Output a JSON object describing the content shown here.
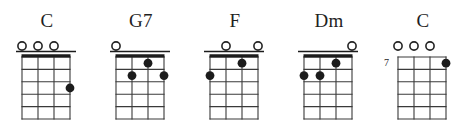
{
  "sheet": {
    "title": "Ukulele Chord Chart",
    "instrument": "ukulele",
    "string_count": 4,
    "fret_rows": 5,
    "background_color": "#ffffff",
    "ink_color": "#1c1c1c"
  },
  "chords": [
    {
      "name": "C",
      "position_label": "",
      "show_nut": true,
      "open_strings": [
        1,
        2,
        3
      ],
      "muted_strings": [],
      "dots": [
        {
          "string": 4,
          "fret": 3
        }
      ]
    },
    {
      "name": "G7",
      "position_label": "",
      "show_nut": true,
      "open_strings": [
        1
      ],
      "muted_strings": [],
      "dots": [
        {
          "string": 3,
          "fret": 1
        },
        {
          "string": 2,
          "fret": 2
        },
        {
          "string": 4,
          "fret": 2
        }
      ]
    },
    {
      "name": "F",
      "position_label": "",
      "show_nut": true,
      "open_strings": [
        2,
        4
      ],
      "muted_strings": [],
      "dots": [
        {
          "string": 3,
          "fret": 1
        },
        {
          "string": 1,
          "fret": 2
        }
      ]
    },
    {
      "name": "Dm",
      "position_label": "",
      "show_nut": true,
      "open_strings": [
        4
      ],
      "muted_strings": [],
      "dots": [
        {
          "string": 3,
          "fret": 1
        },
        {
          "string": 1,
          "fret": 2
        },
        {
          "string": 2,
          "fret": 2
        }
      ]
    },
    {
      "name": "C",
      "position_label": "7",
      "show_nut": false,
      "open_strings": [
        1,
        2,
        3
      ],
      "muted_strings": [],
      "dots": [
        {
          "string": 4,
          "fret": 1
        }
      ]
    }
  ]
}
